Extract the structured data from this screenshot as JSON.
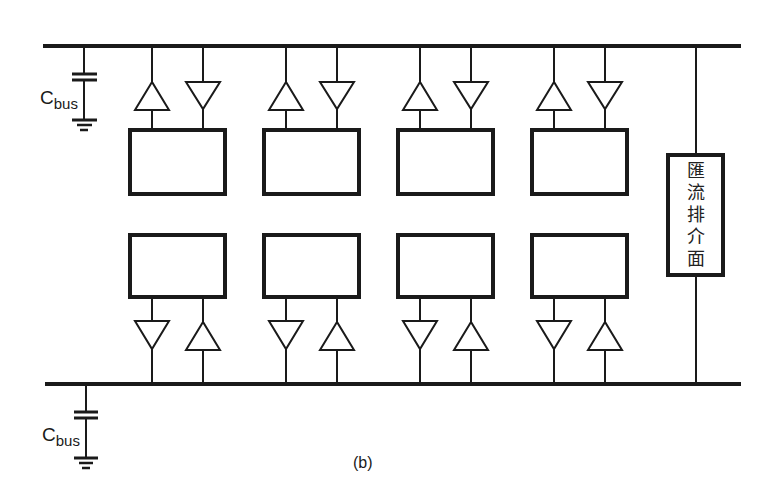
{
  "diagram": {
    "type": "bus architecture with tri-state drivers/receivers",
    "caption": "(b)",
    "top_capacitor": {
      "label_main": "C",
      "label_sub": "bus"
    },
    "bottom_capacitor": {
      "label_main": "C",
      "label_sub": "bus"
    },
    "bus_interface": {
      "label_chars": [
        "匯",
        "流",
        "排",
        "介",
        "面"
      ],
      "label": "匯流排介面"
    },
    "top_blocks_count": 4,
    "bottom_blocks_count": 4,
    "colors": {
      "stroke": "#1a1a1a",
      "background": "#ffffff"
    }
  }
}
